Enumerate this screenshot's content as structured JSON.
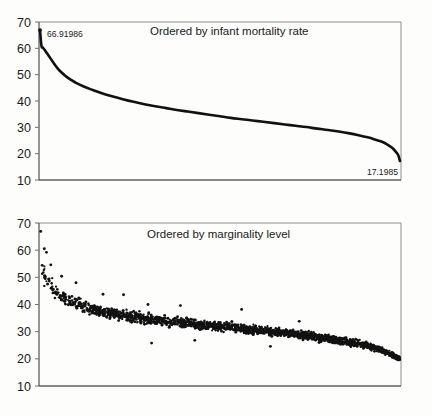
{
  "figure": {
    "name": "two-panel-infant-mortality-figure",
    "background_color": "#fdfdfc",
    "ink_color": "#111111",
    "axis_color": "#4a4a4a",
    "frame_color": "#8e8e8e"
  },
  "panels": [
    {
      "id": "top",
      "title": "Ordered by infant mortality rate",
      "type": "line",
      "ylabel": "",
      "xlabel": "",
      "ylim": [
        10,
        70
      ],
      "yticks": [
        70,
        60,
        50,
        40,
        30,
        20,
        10
      ],
      "ytick_labels": [
        "70",
        "60",
        "50",
        "40",
        "30",
        "20",
        "10"
      ],
      "grid": false,
      "legend": "none",
      "annotations": [
        {
          "name": "max-value-label",
          "text": "66.91986",
          "position": "top-left",
          "value": 66.91986
        },
        {
          "name": "min-value-label",
          "text": "17.1985",
          "position": "bottom-right",
          "value": 17.1985
        }
      ]
    },
    {
      "id": "bottom",
      "title": "Ordered by marginality level",
      "type": "scatter",
      "ylabel": "",
      "xlabel": "",
      "ylim": [
        10,
        70
      ],
      "yticks": [
        70,
        60,
        50,
        40,
        30,
        20,
        10
      ],
      "ytick_labels": [
        "70",
        "60",
        "50",
        "40",
        "30",
        "20",
        "10"
      ],
      "grid": false,
      "legend": "none",
      "annotations": []
    }
  ],
  "chart_data": [
    {
      "id": "top",
      "type": "line",
      "title": "Ordered by infant mortality rate",
      "xlabel": "",
      "ylabel": "",
      "ylim": [
        10,
        70
      ],
      "xlim": [
        0,
        1
      ],
      "yticks": [
        70,
        60,
        50,
        40,
        30,
        20,
        10
      ],
      "grid": false,
      "legend": "none",
      "description": "Monotonically decreasing sorted curve of infant mortality rate across all observations, from a maximum of 66.91986 to a minimum of 17.1985.",
      "series": [
        {
          "name": "infant mortality rate (sorted descending)",
          "x": [
            0.0,
            0.004,
            0.008,
            0.012,
            0.016,
            0.02,
            0.025,
            0.03,
            0.035,
            0.04,
            0.05,
            0.06,
            0.07,
            0.08,
            0.09,
            0.1,
            0.12,
            0.14,
            0.16,
            0.18,
            0.2,
            0.23,
            0.26,
            0.29,
            0.32,
            0.35,
            0.38,
            0.41,
            0.44,
            0.47,
            0.5,
            0.53,
            0.56,
            0.59,
            0.62,
            0.65,
            0.68,
            0.71,
            0.74,
            0.77,
            0.8,
            0.83,
            0.86,
            0.885,
            0.91,
            0.93,
            0.95,
            0.965,
            0.978,
            0.988,
            0.995,
            1.0
          ],
          "y": [
            66.92,
            61.0,
            60.3,
            59.6,
            58.8,
            58.0,
            57.0,
            56.0,
            55.0,
            54.0,
            52.2,
            50.8,
            49.6,
            48.6,
            47.7,
            46.9,
            45.6,
            44.5,
            43.5,
            42.6,
            41.8,
            40.7,
            39.7,
            38.8,
            38.0,
            37.3,
            36.6,
            36.0,
            35.4,
            34.8,
            34.2,
            33.6,
            33.1,
            32.6,
            32.1,
            31.6,
            31.1,
            30.6,
            30.1,
            29.5,
            29.0,
            28.4,
            27.7,
            27.0,
            26.2,
            25.4,
            24.5,
            23.4,
            22.2,
            20.8,
            19.5,
            17.2
          ]
        }
      ],
      "annotations": [
        {
          "text": "66.91986",
          "x": 0.0,
          "y": 66.91986
        },
        {
          "text": "17.1985",
          "x": 1.0,
          "y": 17.1985
        }
      ]
    },
    {
      "id": "bottom",
      "type": "scatter",
      "title": "Ordered by marginality level",
      "xlabel": "",
      "ylabel": "",
      "ylim": [
        10,
        70
      ],
      "xlim": [
        0,
        1
      ],
      "yticks": [
        70,
        60,
        50,
        40,
        30,
        20,
        10
      ],
      "grid": false,
      "legend": "none",
      "description": "Dense scatter of infant mortality rate against observations ordered by marginality level; values decline from roughly 67 at the left to about 19 at the right with substantial vertical dispersion that narrows toward the right.",
      "n_points": 1800,
      "trend": {
        "name": "central tendency of scatter",
        "x": [
          0.0,
          0.01,
          0.02,
          0.035,
          0.05,
          0.075,
          0.1,
          0.14,
          0.18,
          0.22,
          0.27,
          0.32,
          0.38,
          0.44,
          0.5,
          0.56,
          0.62,
          0.68,
          0.74,
          0.8,
          0.86,
          0.91,
          0.95,
          0.98,
          1.0
        ],
        "y": [
          58.0,
          51.5,
          48.5,
          46.0,
          44.0,
          42.0,
          40.5,
          38.5,
          37.2,
          36.2,
          35.2,
          34.3,
          33.4,
          32.6,
          31.9,
          31.2,
          30.4,
          29.5,
          28.5,
          27.4,
          26.1,
          24.8,
          23.2,
          21.4,
          20.0
        ],
        "spread": [
          9.0,
          8.0,
          7.0,
          6.4,
          6.0,
          5.6,
          5.4,
          5.0,
          4.8,
          4.6,
          4.4,
          4.3,
          4.2,
          4.1,
          4.0,
          3.9,
          3.8,
          3.6,
          3.4,
          3.2,
          3.0,
          2.8,
          2.5,
          2.2,
          2.0
        ]
      },
      "outliers": [
        {
          "x": 0.002,
          "y": 66.9
        },
        {
          "x": 0.012,
          "y": 60.5
        },
        {
          "x": 0.018,
          "y": 59.2
        },
        {
          "x": 0.03,
          "y": 54.6
        },
        {
          "x": 0.06,
          "y": 50.4
        },
        {
          "x": 0.1,
          "y": 48.0
        },
        {
          "x": 0.175,
          "y": 43.8
        },
        {
          "x": 0.232,
          "y": 43.6
        },
        {
          "x": 0.3,
          "y": 40.0
        },
        {
          "x": 0.39,
          "y": 39.6
        },
        {
          "x": 0.56,
          "y": 38.2
        },
        {
          "x": 0.72,
          "y": 33.8
        },
        {
          "x": 0.31,
          "y": 25.8
        },
        {
          "x": 0.43,
          "y": 26.8
        },
        {
          "x": 0.64,
          "y": 24.6
        }
      ]
    }
  ]
}
